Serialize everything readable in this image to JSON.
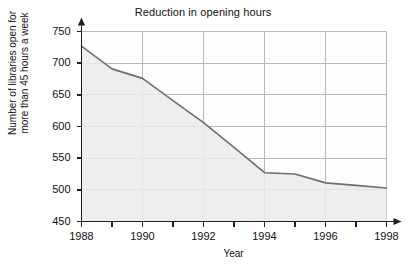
{
  "chart_data": {
    "type": "area",
    "title": "Reduction in opening hours",
    "xlabel": "Year",
    "ylabel_line1": "Number of libraries open for",
    "ylabel_line2": "more than 45 hours a week",
    "x": [
      1988,
      1989,
      1990,
      1991,
      1992,
      1993,
      1994,
      1995,
      1996,
      1997,
      1998
    ],
    "values": [
      727,
      691,
      676,
      641,
      606,
      567,
      527,
      525,
      511,
      507,
      503
    ],
    "series": [
      {
        "name": "Number of libraries open for more than 45 hours a week",
        "values": [
          727,
          691,
          676,
          641,
          606,
          567,
          527,
          525,
          511,
          507,
          503
        ]
      }
    ],
    "xlim": [
      1988,
      1998
    ],
    "ylim": [
      450,
      750
    ],
    "ytick_labels": [
      "450",
      "500",
      "550",
      "600",
      "650",
      "700",
      "750"
    ],
    "ytick_values": [
      450,
      500,
      550,
      600,
      650,
      700,
      750
    ],
    "xtick_values": [
      1988,
      1989,
      1990,
      1991,
      1992,
      1993,
      1994,
      1995,
      1996,
      1997,
      1998
    ],
    "xtick_labels_shown": [
      "1988",
      "1990",
      "1992",
      "1994",
      "1996",
      "1998"
    ],
    "xtick_labeled_values": [
      1988,
      1990,
      1992,
      1994,
      1996,
      1998
    ],
    "grid": true,
    "legend": "none",
    "colors": {
      "background": "#ffffff",
      "plot_fill": "#ebebeb",
      "grid_line": "#b9b9b9",
      "axis_line": "#1f1f1f",
      "series_line": "#6e6e6e",
      "text": "#111111"
    }
  }
}
